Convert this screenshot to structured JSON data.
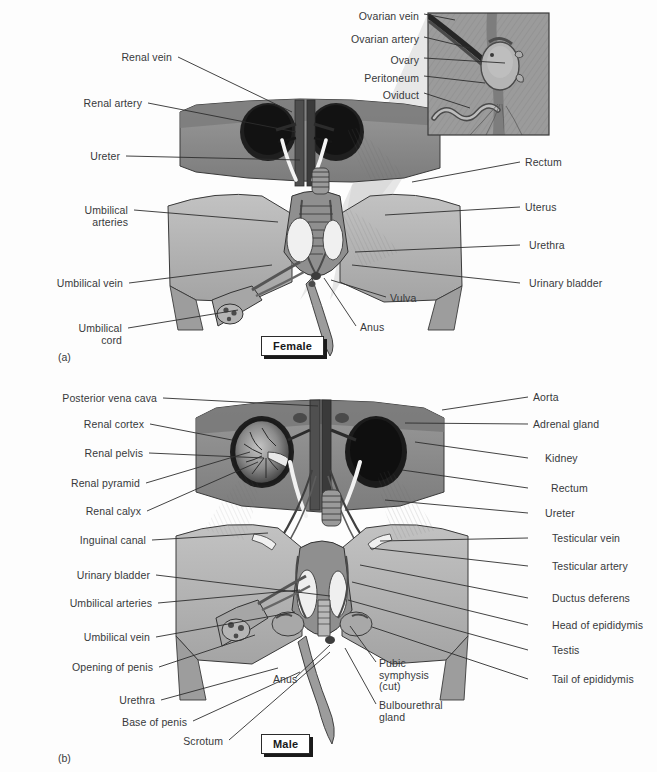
{
  "figure": {
    "background_color": "#fdfdfd",
    "text_color": "#37393b",
    "leader_color": "#2e2e2e"
  },
  "panels": [
    {
      "id": "a",
      "letter": "(a)",
      "sex_label": "Female",
      "letter_pos": {
        "x": 58,
        "y": 351
      },
      "sexbox_pos": {
        "x": 261,
        "y": 336
      }
    },
    {
      "id": "b",
      "letter": "(b)",
      "sex_label": "Male",
      "letter_pos": {
        "x": 58,
        "y": 752
      },
      "sexbox_pos": {
        "x": 261,
        "y": 734
      }
    }
  ],
  "inset": {
    "name": "ovary-detail-inset",
    "box": {
      "x": 428,
      "y": 13,
      "w": 121,
      "h": 122
    },
    "labels": [
      {
        "text": "Ovarian vein",
        "tx": 419,
        "ty": 11,
        "lx1": 424,
        "ly1": 14,
        "lx2": 455,
        "ly2": 20
      },
      {
        "text": "Ovarian artery",
        "tx": 419,
        "ty": 34,
        "lx1": 424,
        "ly1": 37,
        "lx2": 470,
        "ly2": 48
      },
      {
        "text": "Ovary",
        "tx": 419,
        "ty": 55,
        "lx1": 424,
        "ly1": 58,
        "lx2": 505,
        "ly2": 63
      },
      {
        "text": "Peritoneum",
        "tx": 419,
        "ty": 73,
        "lx1": 424,
        "ly1": 76,
        "lx2": 485,
        "ly2": 83
      },
      {
        "text": "Oviduct",
        "tx": 419,
        "ty": 90,
        "lx1": 424,
        "ly1": 93,
        "lx2": 470,
        "ly2": 108
      }
    ]
  },
  "female": {
    "left_labels": [
      {
        "text": "Renal vein",
        "tx": 172,
        "ty": 52,
        "lx1": 178,
        "ly1": 57,
        "lx2": 292,
        "ly2": 112
      },
      {
        "text": "Renal artery",
        "tx": 142,
        "ty": 98,
        "lx1": 148,
        "ly1": 103,
        "lx2": 296,
        "ly2": 132
      },
      {
        "text": "Ureter",
        "tx": 120,
        "ty": 151,
        "lx1": 126,
        "ly1": 156,
        "lx2": 300,
        "ly2": 160
      },
      {
        "text": "Umbilical\narteries",
        "tx": 128,
        "ty": 205,
        "lx1": 134,
        "ly1": 210,
        "lx2": 278,
        "ly2": 222
      },
      {
        "text": "Umbilical vein",
        "tx": 123,
        "ty": 278,
        "lx1": 129,
        "ly1": 283,
        "lx2": 272,
        "ly2": 265
      },
      {
        "text": "Umbilical\ncord",
        "tx": 122,
        "ty": 323,
        "lx1": 128,
        "ly1": 328,
        "lx2": 238,
        "ly2": 310
      }
    ],
    "right_labels": [
      {
        "text": "Rectum",
        "tx": 525,
        "ty": 157,
        "lx1": 520,
        "ly1": 162,
        "lx2": 412,
        "ly2": 182
      },
      {
        "text": "Uterus",
        "tx": 525,
        "ty": 202,
        "lx1": 520,
        "ly1": 207,
        "lx2": 385,
        "ly2": 215
      },
      {
        "text": "Urethra",
        "tx": 529,
        "ty": 240,
        "lx1": 520,
        "ly1": 245,
        "lx2": 355,
        "ly2": 252
      },
      {
        "text": "Urinary bladder",
        "tx": 529,
        "ty": 278,
        "lx1": 520,
        "ly1": 283,
        "lx2": 352,
        "ly2": 265
      }
    ],
    "center_labels": [
      {
        "text": "Vulva",
        "tx": 390,
        "ty": 293,
        "lx1": 386,
        "ly1": 297,
        "lx2": 331,
        "ly2": 280
      },
      {
        "text": "Anus",
        "tx": 360,
        "ty": 322,
        "lx1": 356,
        "ly1": 326,
        "lx2": 324,
        "ly2": 278
      }
    ]
  },
  "male": {
    "left_labels": [
      {
        "text": "Posterior vena cava",
        "tx": 157,
        "ty": 393,
        "lx1": 163,
        "ly1": 398,
        "lx2": 318,
        "ly2": 406
      },
      {
        "text": "Renal cortex",
        "tx": 144,
        "ty": 419,
        "lx1": 150,
        "ly1": 424,
        "lx2": 232,
        "ly2": 440
      },
      {
        "text": "Renal pelvis",
        "tx": 143,
        "ty": 448,
        "lx1": 149,
        "ly1": 453,
        "lx2": 264,
        "ly2": 458
      },
      {
        "text": "Renal pyramid",
        "tx": 140,
        "ty": 478,
        "lx1": 146,
        "ly1": 483,
        "lx2": 250,
        "ly2": 452
      },
      {
        "text": "Renal calyx",
        "tx": 141,
        "ty": 506,
        "lx1": 147,
        "ly1": 511,
        "lx2": 258,
        "ly2": 462
      },
      {
        "text": "Inguinal canal",
        "tx": 146,
        "ty": 535,
        "lx1": 152,
        "ly1": 540,
        "lx2": 268,
        "ly2": 533
      },
      {
        "text": "Urinary bladder",
        "tx": 150,
        "ty": 570,
        "lx1": 156,
        "ly1": 575,
        "lx2": 330,
        "ly2": 596
      },
      {
        "text": "Umbilical arteries",
        "tx": 152,
        "ty": 598,
        "lx1": 158,
        "ly1": 603,
        "lx2": 300,
        "ly2": 590
      },
      {
        "text": "Umbilical vein",
        "tx": 150,
        "ty": 632,
        "lx1": 156,
        "ly1": 637,
        "lx2": 295,
        "ly2": 612
      },
      {
        "text": "Opening of penis",
        "tx": 153,
        "ty": 662,
        "lx1": 159,
        "ly1": 667,
        "lx2": 255,
        "ly2": 635
      },
      {
        "text": "Urethra",
        "tx": 155,
        "ty": 695,
        "lx1": 161,
        "ly1": 700,
        "lx2": 278,
        "ly2": 668
      },
      {
        "text": "Base of penis",
        "tx": 187,
        "ty": 717,
        "lx1": 193,
        "ly1": 721,
        "lx2": 300,
        "ly2": 672
      },
      {
        "text": "Scrotum",
        "tx": 223,
        "ty": 736,
        "lx1": 229,
        "ly1": 740,
        "lx2": 330,
        "ly2": 652
      }
    ],
    "right_labels": [
      {
        "text": "Aorta",
        "tx": 533,
        "ty": 392,
        "lx1": 528,
        "ly1": 397,
        "lx2": 442,
        "ly2": 410
      },
      {
        "text": "Adrenal gland",
        "tx": 533,
        "ty": 419,
        "lx1": 528,
        "ly1": 424,
        "lx2": 405,
        "ly2": 423
      },
      {
        "text": "Kidney",
        "tx": 545,
        "ty": 453,
        "lx1": 528,
        "ly1": 458,
        "lx2": 415,
        "ly2": 442
      },
      {
        "text": "Rectum",
        "tx": 551,
        "ty": 483,
        "lx1": 528,
        "ly1": 488,
        "lx2": 402,
        "ly2": 470
      },
      {
        "text": "Ureter",
        "tx": 545,
        "ty": 508,
        "lx1": 528,
        "ly1": 513,
        "lx2": 385,
        "ly2": 500
      },
      {
        "text": "Testicular vein",
        "tx": 552,
        "ty": 533,
        "lx1": 528,
        "ly1": 538,
        "lx2": 380,
        "ly2": 541
      },
      {
        "text": "Testicular artery",
        "tx": 552,
        "ty": 561,
        "lx1": 528,
        "ly1": 566,
        "lx2": 370,
        "ly2": 548
      },
      {
        "text": "Ductus deferens",
        "tx": 552,
        "ty": 593,
        "lx1": 528,
        "ly1": 598,
        "lx2": 360,
        "ly2": 565
      },
      {
        "text": "Head of epididymis",
        "tx": 552,
        "ty": 620,
        "lx1": 528,
        "ly1": 625,
        "lx2": 352,
        "ly2": 582
      },
      {
        "text": "Testis",
        "tx": 552,
        "ty": 645,
        "lx1": 528,
        "ly1": 650,
        "lx2": 348,
        "ly2": 600
      },
      {
        "text": "Tail of epididymis",
        "tx": 552,
        "ty": 674,
        "lx1": 528,
        "ly1": 679,
        "lx2": 372,
        "ly2": 627
      }
    ],
    "center_labels": [
      {
        "text": "Anus",
        "tx": 273,
        "ty": 674,
        "lx1": 295,
        "ly1": 678,
        "lx2": 330,
        "ly2": 645
      },
      {
        "text": "Pubic\nsymphysis\n(cut)",
        "tx": 379,
        "ty": 658,
        "lx1": 376,
        "ly1": 662,
        "lx2": 350,
        "ly2": 626
      },
      {
        "text": "Bulbourethral\ngland",
        "tx": 379,
        "ty": 700,
        "lx1": 376,
        "ly1": 704,
        "lx2": 345,
        "ly2": 648
      }
    ]
  },
  "palette": {
    "muscle_mid": "#8d8d8d",
    "muscle_dark": "#6e6e6e",
    "muscle_light": "#b0b0b0",
    "kidney_dark": "#2a2a2a",
    "kidney_mid": "#59595a",
    "vessel_white": "#f2f2f2",
    "skin_light": "#bdbdbd",
    "skin_mid": "#a2a2a2",
    "outline": "#303030",
    "inset_bg": "#9e9e9e",
    "cone_light": "#c9c9c9"
  }
}
